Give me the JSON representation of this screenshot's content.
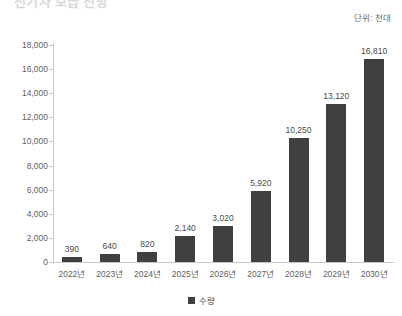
{
  "title": {
    "text": "전기차 보급 전망",
    "cut_off": true
  },
  "unit_annotation": "단위: 천대",
  "legend": {
    "position": "bottom-center",
    "marker": "square-swatch",
    "entries": [
      {
        "label": "수량",
        "color": "#404040"
      }
    ]
  },
  "colors": {
    "bar": "#404040",
    "axis": "#c9c9c9",
    "tick_text": "#5e5e5e",
    "value_text": "#4a4a4a",
    "background": "#ffffff"
  },
  "chart_data": {
    "type": "bar",
    "title": "전기차 보급 전망",
    "xlabel": "",
    "ylabel": "",
    "unit": "단위: 천대",
    "ylim": [
      0,
      18000
    ],
    "ytick_step": 2000,
    "grid": false,
    "legend_position": "bottom-center",
    "categories": [
      "2022년",
      "2023년",
      "2024년",
      "2025년",
      "2026년",
      "2027년",
      "2028년",
      "2029년",
      "2030년"
    ],
    "ytick_labels": [
      "0",
      "2,000",
      "4,000",
      "6,000",
      "8,000",
      "10,000",
      "12,000",
      "14,000",
      "16,000",
      "18,000"
    ],
    "ytick_values": [
      0,
      2000,
      4000,
      6000,
      8000,
      10000,
      12000,
      14000,
      16000,
      18000
    ],
    "series": [
      {
        "name": "수량",
        "color": "#404040",
        "values": [
          390,
          640,
          820,
          2140,
          3020,
          5920,
          10250,
          13120,
          16810
        ],
        "value_labels": [
          "390",
          "640",
          "820",
          "2,140",
          "3,020",
          "5,920",
          "10,250",
          "13,120",
          "16,810"
        ]
      }
    ]
  }
}
